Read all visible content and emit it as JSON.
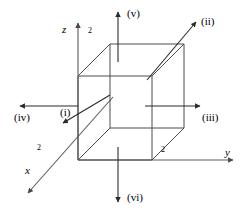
{
  "figure": {
    "background_color": "#ffffff",
    "line_color": "#4d4d4d",
    "text_color": "#000000"
  },
  "axes": {
    "z": {
      "label": "z",
      "tick_label": "2",
      "direction": "up"
    },
    "y": {
      "label": "y",
      "tick_label": "2",
      "direction": "right"
    },
    "x": {
      "label": "x",
      "tick_label": "2",
      "direction": "down-left"
    }
  },
  "flux_arrows": [
    {
      "id": "i",
      "label": "(i)",
      "direction": "down-left-diagonal",
      "face": "front-left-diagonal"
    },
    {
      "id": "ii",
      "label": "(ii)",
      "direction": "up-right-diagonal",
      "face": "back-top-right"
    },
    {
      "id": "iii",
      "label": "(iii)",
      "direction": "right",
      "face": "right"
    },
    {
      "id": "iv",
      "label": "(iv)",
      "direction": "left",
      "face": "left"
    },
    {
      "id": "v",
      "label": "(v)",
      "direction": "up",
      "face": "top"
    },
    {
      "id": "vi",
      "label": "(vi)",
      "direction": "down",
      "face": "bottom"
    }
  ]
}
